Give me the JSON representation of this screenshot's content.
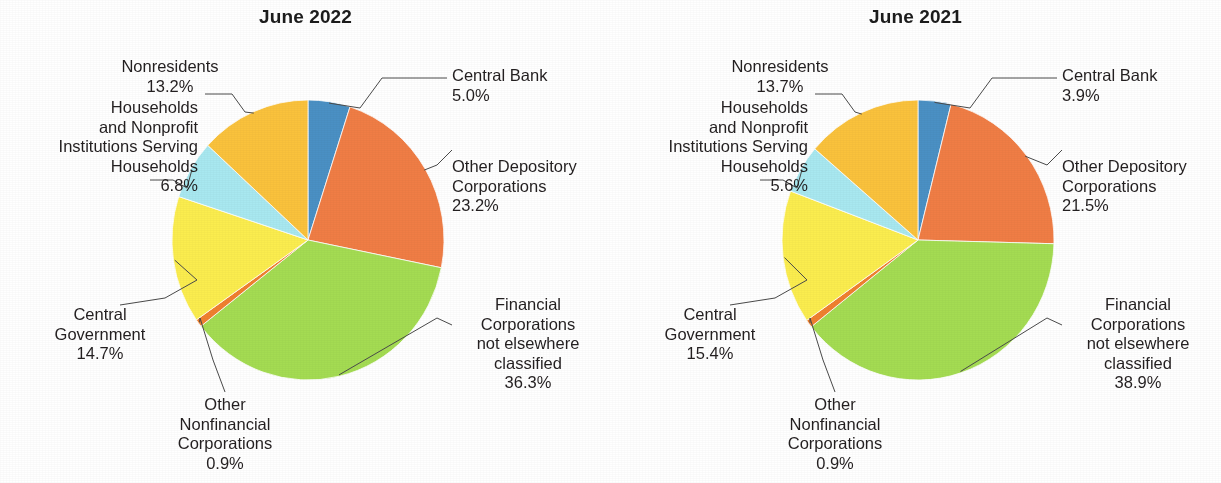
{
  "chart_data": [
    {
      "type": "pie",
      "title": "June 2022",
      "xlabel": "",
      "ylabel": "",
      "legend_position": "callout-labels",
      "grid": false,
      "start_angle_deg": 0,
      "direction": "clockwise",
      "categories": [
        "Central Bank",
        "Other Depository Corporations",
        "Financial Corporations not elsewhere classified",
        "Other Nonfinancial Corporations",
        "Central Government",
        "Households and Nonprofit Institutions Serving Households",
        "Nonresidents"
      ],
      "values": [
        5.0,
        23.2,
        36.3,
        0.9,
        14.7,
        6.8,
        13.2
      ],
      "value_labels": [
        "5.0%",
        "23.2%",
        "36.3%",
        "0.9%",
        "14.7%",
        "6.8%",
        "13.2%"
      ],
      "colors": [
        "#4a90c4",
        "#f07d45",
        "#a4dc52",
        "#f0802f",
        "#fbed4e",
        "#a8e8f0",
        "#fac23c"
      ],
      "labels": [
        {
          "name": "Central Bank",
          "pct": "5.0%"
        },
        {
          "name": "Other Depository\nCorporations",
          "pct": "23.2%"
        },
        {
          "name": "Financial\nCorporations\nnot elsewhere\nclassified",
          "pct": "36.3%"
        },
        {
          "name": "Other\nNonfinancial\nCorporations",
          "pct": "0.9%"
        },
        {
          "name": "Central\nGovernment",
          "pct": "14.7%"
        },
        {
          "name": "Households\nand Nonprofit\nInstitutions Serving\nHouseholds",
          "pct": "6.8%"
        },
        {
          "name": "Nonresidents",
          "pct": "13.2%"
        }
      ]
    },
    {
      "type": "pie",
      "title": "June 2021",
      "xlabel": "",
      "ylabel": "",
      "legend_position": "callout-labels",
      "grid": false,
      "start_angle_deg": 0,
      "direction": "clockwise",
      "categories": [
        "Central Bank",
        "Other Depository Corporations",
        "Financial Corporations not elsewhere classified",
        "Other Nonfinancial Corporations",
        "Central Government",
        "Households and Nonprofit Institutions Serving Households",
        "Nonresidents"
      ],
      "values": [
        3.9,
        21.5,
        38.9,
        0.9,
        15.4,
        5.6,
        13.7
      ],
      "value_labels": [
        "3.9%",
        "21.5%",
        "38.9%",
        "0.9%",
        "15.4%",
        "5.6%",
        "13.7%"
      ],
      "colors": [
        "#4a90c4",
        "#f07d45",
        "#a4dc52",
        "#f0802f",
        "#fbed4e",
        "#a8e8f0",
        "#fac23c"
      ],
      "labels": [
        {
          "name": "Central Bank",
          "pct": "3.9%"
        },
        {
          "name": "Other Depository\nCorporations",
          "pct": "21.5%"
        },
        {
          "name": "Financial\nCorporations\nnot elsewhere\nclassified",
          "pct": "38.9%"
        },
        {
          "name": "Other\nNonfinancial\nCorporations",
          "pct": "0.9%"
        },
        {
          "name": "Central\nGovernment",
          "pct": "15.4%"
        },
        {
          "name": "Households\nand Nonprofit\nInstitutions Serving\nHouseholds",
          "pct": "5.6%"
        },
        {
          "name": "Nonresidents",
          "pct": "13.7%"
        }
      ]
    }
  ]
}
